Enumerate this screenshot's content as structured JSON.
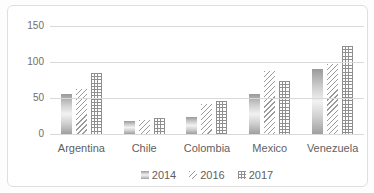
{
  "chart_data": {
    "type": "bar",
    "title": "",
    "xlabel": "",
    "ylabel": "",
    "categories": [
      "Argentina",
      "Chile",
      "Colombia",
      "Mexico",
      "Venezuela"
    ],
    "series": [
      {
        "name": "2014",
        "pattern": "gradient-gray",
        "values": [
          55,
          18,
          24,
          55,
          90
        ]
      },
      {
        "name": "2016",
        "pattern": "diagonal-hatch",
        "values": [
          62,
          19,
          42,
          87,
          97
        ]
      },
      {
        "name": "2017",
        "pattern": "grid-check",
        "values": [
          85,
          22,
          46,
          73,
          122
        ]
      }
    ],
    "ylim": [
      0,
      150
    ],
    "yticks": [
      0,
      50,
      100,
      150
    ],
    "grid": true,
    "legend_position": "bottom"
  },
  "style": {
    "grid_color": "#d9d9d9",
    "axis_text_color": "#6e6e6e",
    "label_text_color": "#5f5f5f",
    "frame_border_color": "#dfdfdf",
    "pattern_line_color": "#8f8f8f",
    "gradient_dark": "#9a9a9a",
    "gradient_light": "#f2f2f2",
    "background": "#ffffff"
  }
}
